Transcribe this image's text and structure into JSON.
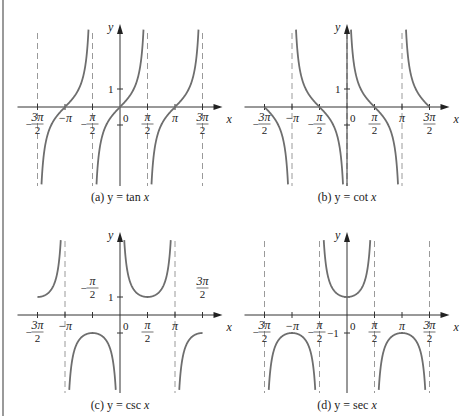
{
  "chart_data": [
    {
      "type": "line",
      "panel": "a",
      "title": "(a) y = tan x",
      "caption_prefix": "(a)",
      "caption_fn": "y = tan x",
      "function": "tan",
      "xlabel": "x",
      "ylabel": "y",
      "x_ticks": [
        "-3π/2",
        "-π",
        "-π/2",
        "0",
        "π/2",
        "π",
        "3π/2"
      ],
      "y_ticks": [
        "1"
      ],
      "asymptotes": [
        "-3π/2",
        "-π/2",
        "π/2",
        "3π/2"
      ],
      "xlim": [
        "-3π/2",
        "3π/2"
      ],
      "ylim": [
        -4.4,
        4.4
      ],
      "zeros": [
        "-π",
        "0",
        "π"
      ]
    },
    {
      "type": "line",
      "panel": "b",
      "title": "(b) y = cot x",
      "caption_prefix": "(b)",
      "caption_fn": "y = cot x",
      "function": "cot",
      "xlabel": "x",
      "ylabel": "y",
      "x_ticks": [
        "-3π/2",
        "-π",
        "-π/2",
        "0",
        "π/2",
        "π",
        "3π/2"
      ],
      "y_ticks": [
        "1"
      ],
      "asymptotes": [
        "-π",
        "0",
        "π"
      ],
      "xlim": [
        "-3π/2",
        "3π/2"
      ],
      "ylim": [
        -4.4,
        4.4
      ],
      "zeros": [
        "-3π/2",
        "-π/2",
        "π/2",
        "3π/2"
      ]
    },
    {
      "type": "line",
      "panel": "c",
      "title": "(c) y = csc x",
      "caption_prefix": "(c)",
      "caption_fn": "y = csc x",
      "function": "csc",
      "xlabel": "x",
      "ylabel": "y",
      "x_ticks": [
        "-3π/2",
        "-π",
        "-π/2",
        "0",
        "π/2",
        "π",
        "3π/2"
      ],
      "y_ticks": [
        "1"
      ],
      "asymptotes": [
        "-π",
        "π"
      ],
      "xlim": [
        "-3π/2",
        "3π/2"
      ],
      "ylim": [
        -4.4,
        4.4
      ],
      "local_extrema": [
        {
          "x": "-3π/2",
          "y": 1
        },
        {
          "x": "-π/2",
          "y": -1
        },
        {
          "x": "π/2",
          "y": 1
        },
        {
          "x": "3π/2",
          "y": -1
        }
      ]
    },
    {
      "type": "line",
      "panel": "d",
      "title": "(d) y = sec x",
      "caption_prefix": "(d)",
      "caption_fn": "y = sec x",
      "function": "sec",
      "xlabel": "x",
      "ylabel": "y",
      "x_ticks": [
        "-3π/2",
        "-π",
        "-π/2",
        "0",
        "π/2",
        "π",
        "3π/2"
      ],
      "y_ticks": [
        "-1"
      ],
      "asymptotes": [
        "-3π/2",
        "-π/2",
        "π/2",
        "3π/2"
      ],
      "xlim": [
        "-3π/2",
        "3π/2"
      ],
      "ylim": [
        -4.4,
        4.4
      ],
      "local_extrema": [
        {
          "x": "-π",
          "y": -1
        },
        {
          "x": "0",
          "y": 1
        },
        {
          "x": "π",
          "y": -1
        }
      ]
    }
  ],
  "labels": {
    "x_axis": "x",
    "y_axis": "y",
    "zero": "0",
    "one": "1",
    "neg_one": "−1",
    "pi": "π",
    "neg_pi": "−π",
    "pi_num": "π",
    "three_pi_num": "3π",
    "two": "2",
    "minus": "−"
  },
  "captions": {
    "a_prefix": "(a)",
    "a_fn": "y = tan",
    "b_prefix": "(b)",
    "b_fn": "y = cot",
    "c_prefix": "(c)",
    "c_fn": "y = csc",
    "d_prefix": "(d)",
    "d_fn": "y = sec",
    "var": "x"
  },
  "colors": {
    "curve": "#6e6e6e",
    "axis": "#333333",
    "asymptote": "#9a9a9a",
    "frame_border": "#9a9a9a"
  }
}
